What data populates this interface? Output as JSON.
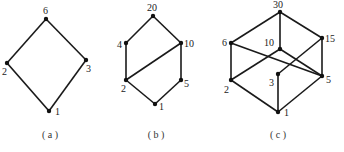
{
  "figure": {
    "graphs": [
      {
        "id": "a",
        "caption": "( a )",
        "caption_pos": [
          50,
          138
        ],
        "nodes": [
          {
            "label": "6",
            "x": 46,
            "y": 19,
            "lx": 43,
            "ly": 14
          },
          {
            "label": "2",
            "x": 7,
            "y": 63,
            "lx": 2,
            "ly": 75
          },
          {
            "label": "3",
            "x": 86,
            "y": 60,
            "lx": 86,
            "ly": 72
          },
          {
            "label": "1",
            "x": 49,
            "y": 111,
            "lx": 55,
            "ly": 115
          }
        ],
        "edges": [
          [
            "6",
            "2"
          ],
          [
            "6",
            "3"
          ],
          [
            "2",
            "1"
          ],
          [
            "3",
            "1"
          ]
        ]
      },
      {
        "id": "b",
        "caption": "( b )",
        "caption_pos": [
          156,
          138
        ],
        "nodes": [
          {
            "label": "20",
            "x": 153,
            "y": 16,
            "lx": 147,
            "ly": 11
          },
          {
            "label": "4",
            "x": 126,
            "y": 43,
            "lx": 117,
            "ly": 48
          },
          {
            "label": "10",
            "x": 181,
            "y": 43,
            "lx": 184,
            "ly": 47
          },
          {
            "label": "2",
            "x": 126,
            "y": 80,
            "lx": 121,
            "ly": 92
          },
          {
            "label": "5",
            "x": 181,
            "y": 80,
            "lx": 184,
            "ly": 87
          },
          {
            "label": "1",
            "x": 155,
            "y": 104,
            "lx": 159,
            "ly": 110
          }
        ],
        "edges": [
          [
            "20",
            "4"
          ],
          [
            "20",
            "10"
          ],
          [
            "4",
            "2"
          ],
          [
            "10",
            "2"
          ],
          [
            "10",
            "5"
          ],
          [
            "2",
            "1"
          ],
          [
            "5",
            "1"
          ]
        ]
      },
      {
        "id": "c",
        "caption": "( c )",
        "caption_pos": [
          278,
          138
        ],
        "nodes": [
          {
            "label": "30",
            "x": 280,
            "y": 12,
            "lx": 273,
            "ly": 8
          },
          {
            "label": "6",
            "x": 231,
            "y": 43,
            "lx": 222,
            "ly": 46
          },
          {
            "label": "10",
            "x": 280,
            "y": 49,
            "lx": 264,
            "ly": 46
          },
          {
            "label": "15",
            "x": 322,
            "y": 38,
            "lx": 325,
            "ly": 42
          },
          {
            "label": "3",
            "x": 278,
            "y": 74,
            "lx": 269,
            "ly": 86
          },
          {
            "label": "2",
            "x": 231,
            "y": 80,
            "lx": 224,
            "ly": 93
          },
          {
            "label": "5",
            "x": 322,
            "y": 76,
            "lx": 326,
            "ly": 83
          },
          {
            "label": "1",
            "x": 278,
            "y": 112,
            "lx": 284,
            "ly": 116
          }
        ],
        "edges": [
          [
            "30",
            "6"
          ],
          [
            "30",
            "10"
          ],
          [
            "30",
            "15"
          ],
          [
            "6",
            "2"
          ],
          [
            "6",
            "5"
          ],
          [
            "10",
            "2"
          ],
          [
            "10",
            "5"
          ],
          [
            "15",
            "3"
          ],
          [
            "15",
            "5"
          ],
          [
            "3",
            "1"
          ],
          [
            "2",
            "1"
          ],
          [
            "5",
            "1"
          ]
        ]
      }
    ]
  }
}
